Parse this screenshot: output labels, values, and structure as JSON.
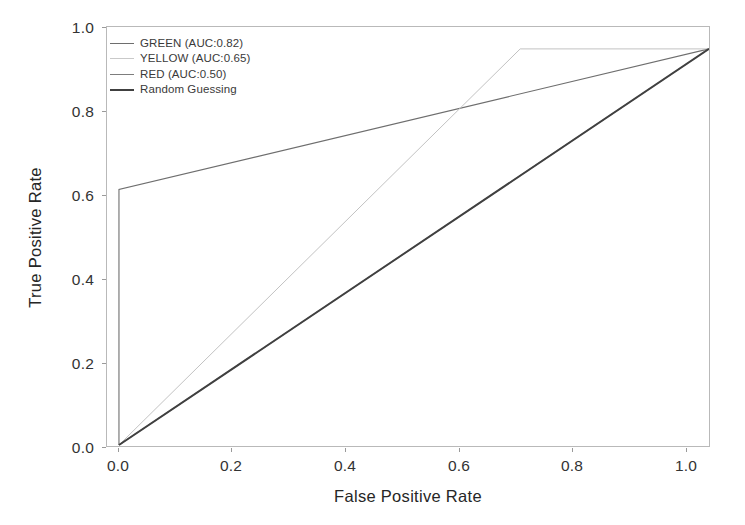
{
  "chart_data": {
    "type": "line",
    "title": "",
    "xlabel": "False Positive Rate",
    "ylabel": "True Positive Rate",
    "xlim": [
      0.0,
      1.0
    ],
    "ylim": [
      0.0,
      1.0
    ],
    "xticks": [
      "0.0",
      "0.2",
      "0.4",
      "0.6",
      "0.8",
      "1.0"
    ],
    "yticks": [
      "0.0",
      "0.2",
      "0.4",
      "0.6",
      "0.8",
      "1.0"
    ],
    "grid": false,
    "legend_position": "upper left",
    "series": [
      {
        "name": "GREEN (AUC:0.82)",
        "label": "GREEN (AUC:0.82)",
        "auc": 0.82,
        "color": "#6e6e6e",
        "linewidth": 1.1,
        "x": [
          0.0,
          0.0,
          1.0
        ],
        "y": [
          0.0,
          0.645,
          1.0
        ]
      },
      {
        "name": "YELLOW (AUC:0.65)",
        "label": "YELLOW (AUC:0.65)",
        "auc": 0.65,
        "color": "#c2c2c2",
        "linewidth": 1.0,
        "x": [
          0.0,
          0.68,
          1.0
        ],
        "y": [
          0.0,
          1.0,
          1.0
        ]
      },
      {
        "name": "RED (AUC:0.50)",
        "label": "RED (AUC:0.50)",
        "auc": 0.5,
        "color": "#7d7d7d",
        "linewidth": 1.2,
        "x": [
          0.0,
          1.0
        ],
        "y": [
          0.0,
          1.0
        ]
      },
      {
        "name": "Random Guessing",
        "label": "Random Guessing",
        "auc": 0.5,
        "color": "#404040",
        "linewidth": 1.9,
        "x": [
          0.0,
          1.0
        ],
        "y": [
          0.0,
          1.0
        ]
      }
    ]
  },
  "axes": {
    "x_title": "False Positive Rate",
    "y_title": "True Positive Rate",
    "x_tick_labels": [
      "0.0",
      "0.2",
      "0.4",
      "0.6",
      "0.8",
      "1.0"
    ],
    "y_tick_labels": [
      "0.0",
      "0.2",
      "0.4",
      "0.6",
      "0.8",
      "1.0"
    ],
    "spine_color": "#b9b9b9"
  },
  "legend": {
    "entries": [
      {
        "label": "GREEN (AUC:0.82)",
        "color": "#6e6e6e",
        "thickness": "1.2px"
      },
      {
        "label": "YELLOW (AUC:0.65)",
        "color": "#c9c9c9",
        "thickness": "1.1px"
      },
      {
        "label": "RED (AUC:0.50)",
        "color": "#7d7d7d",
        "thickness": "1.3px"
      },
      {
        "label": "Random Guessing",
        "color": "#404040",
        "thickness": "2.2px"
      }
    ]
  }
}
